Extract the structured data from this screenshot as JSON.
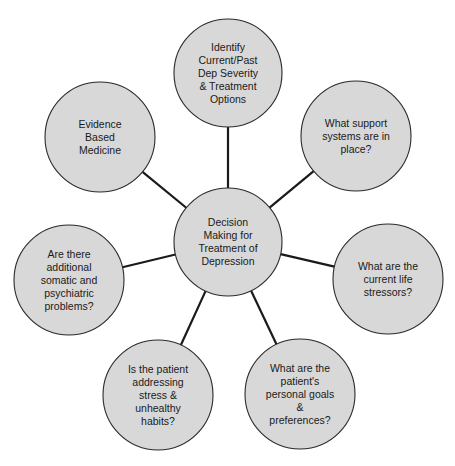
{
  "diagram": {
    "type": "hub-and-spoke",
    "colors": {
      "node_fill": "#d8d8d8",
      "node_stroke": "#2a2a2a",
      "line": "#1a1a1a",
      "background": "#ffffff"
    },
    "center": {
      "label": "Decision\nMaking for\nTreatment of\nDepression",
      "cx": 228,
      "cy": 242,
      "r": 54
    },
    "nodes": [
      {
        "id": "identify-severity",
        "label": "Identify\nCurrent/Past\nDep Severity\n& Treatment\nOptions",
        "cx": 228,
        "cy": 73,
        "r": 54
      },
      {
        "id": "support-systems",
        "label": "What support\nsystems are in\nplace?",
        "cx": 356,
        "cy": 136,
        "r": 55
      },
      {
        "id": "life-stressors",
        "label": "What are the\ncurrent life\nstressors?",
        "cx": 388,
        "cy": 279,
        "r": 55
      },
      {
        "id": "goals-preferences",
        "label": "What are the\npatient's\npersonal goals\n&\npreferences?",
        "cx": 300,
        "cy": 394,
        "r": 55
      },
      {
        "id": "stress-habits",
        "label": "Is the patient\naddressing\nstress &\nunhealthy\nhabits?",
        "cx": 158,
        "cy": 395,
        "r": 55
      },
      {
        "id": "somatic-psychiatric",
        "label": "Are there\nadditional\nsomatic and\npsychiatric\nproblems?",
        "cx": 69,
        "cy": 280,
        "r": 55
      },
      {
        "id": "evidence-based",
        "label": "Evidence\nBased\nMedicine",
        "cx": 100,
        "cy": 137,
        "r": 55
      }
    ]
  }
}
